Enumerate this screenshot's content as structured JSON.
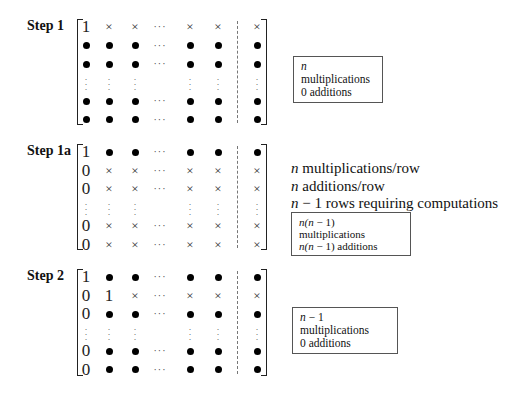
{
  "steps": [
    {
      "label": "Step 1",
      "rows": [
        [
          "1",
          "x",
          "x",
          "hdots",
          "x",
          "x",
          "x"
        ],
        [
          "dot",
          "dot",
          "dot",
          "hdots",
          "dot",
          "dot",
          "dot"
        ],
        [
          "dot",
          "dot",
          "dot",
          "hdots",
          "dot",
          "dot",
          "dot"
        ],
        [
          "vdots",
          "vdots",
          "vdots",
          "",
          "vdots",
          "vdots",
          "vdots"
        ],
        [
          "dot",
          "dot",
          "dot",
          "hdots",
          "dot",
          "dot",
          "dot"
        ],
        [
          "dot",
          "dot",
          "dot",
          "hdots",
          "dot",
          "dot",
          "dot"
        ]
      ],
      "box": {
        "line1_var": "n",
        "line1_text": " multiplications",
        "line2": "0 additions"
      }
    },
    {
      "label": "Step 1a",
      "rows": [
        [
          "1",
          "dot",
          "dot",
          "hdots",
          "dot",
          "dot",
          "dot"
        ],
        [
          "0",
          "x",
          "x",
          "hdots",
          "x",
          "x",
          "x"
        ],
        [
          "0",
          "x",
          "x",
          "hdots",
          "x",
          "x",
          "x"
        ],
        [
          "vdots",
          "vdots",
          "vdots",
          "",
          "vdots",
          "vdots",
          "vdots"
        ],
        [
          "0",
          "x",
          "x",
          "hdots",
          "x",
          "x",
          "x"
        ],
        [
          "0",
          "x",
          "x",
          "hdots",
          "x",
          "x",
          "x"
        ]
      ],
      "notes": [
        {
          "var": "n",
          "text": " multiplications/row"
        },
        {
          "var": "n",
          "text": " additions/row"
        },
        {
          "var": "n",
          "text": " − 1 rows requiring computations"
        }
      ],
      "box": {
        "line1_var": "n(n",
        "line1_text": " − 1) multiplications",
        "line2_var": "n(n",
        "line2_text": " − 1) additions"
      }
    },
    {
      "label": "Step 2",
      "rows": [
        [
          "1",
          "dot",
          "dot",
          "hdots",
          "dot",
          "dot",
          "dot"
        ],
        [
          "0",
          "1",
          "x",
          "hdots",
          "x",
          "x",
          "x"
        ],
        [
          "0",
          "dot",
          "dot",
          "hdots",
          "dot",
          "dot",
          "dot"
        ],
        [
          "vdots",
          "vdots",
          "vdots",
          "",
          "vdots",
          "vdots",
          "vdots"
        ],
        [
          "0",
          "dot",
          "dot",
          "hdots",
          "dot",
          "dot",
          "dot"
        ],
        [
          "0",
          "dot",
          "dot",
          "hdots",
          "dot",
          "dot",
          "dot"
        ]
      ],
      "box": {
        "line1_var": "n",
        "line1_text": " − 1 multiplications",
        "line2": "0 additions"
      }
    }
  ]
}
